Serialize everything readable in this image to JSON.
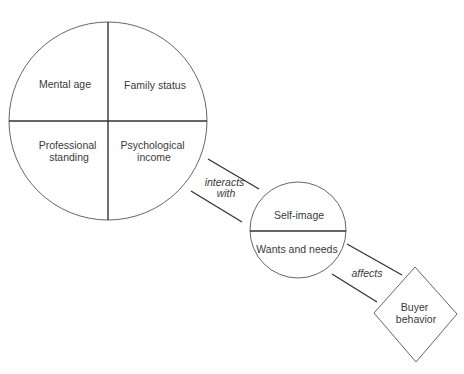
{
  "diagram": {
    "big_circle": {
      "quadrants": {
        "top_left": [
          "Mental age"
        ],
        "top_right": [
          "Family status"
        ],
        "bottom_left": [
          "Professional",
          "standing"
        ],
        "bottom_right": [
          "Psychological",
          "income"
        ]
      }
    },
    "connector_1": {
      "label": [
        "interacts",
        "with"
      ]
    },
    "small_circle": {
      "top": "Self-image",
      "bottom": "Wants and needs"
    },
    "connector_2": {
      "label": "affects"
    },
    "diamond": {
      "label": [
        "Buyer",
        "behavior"
      ]
    },
    "colors": {
      "stroke": "#555555",
      "divider": "#333333",
      "text": "#3a3a3a",
      "background": "#ffffff"
    }
  }
}
